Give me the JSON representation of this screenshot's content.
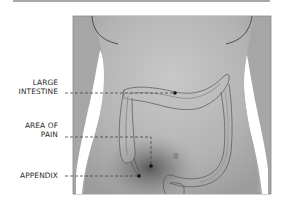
{
  "diagram": {
    "type": "anatomical-illustration",
    "labels": [
      {
        "id": "large-intestine",
        "lines": [
          "LARGE",
          "INTESTINE"
        ]
      },
      {
        "id": "area-of-pain",
        "lines": [
          "AREA OF",
          "PAIN"
        ]
      },
      {
        "id": "appendix",
        "lines": [
          "APPENDIX"
        ]
      }
    ],
    "colors": {
      "skin_shade": "#9a9a9a",
      "skin_light": "#c2c2c2",
      "pain_shadow": "#5e5e5e",
      "outline": "#555555",
      "leader_line": "#444444",
      "background": "#ffffff"
    }
  }
}
